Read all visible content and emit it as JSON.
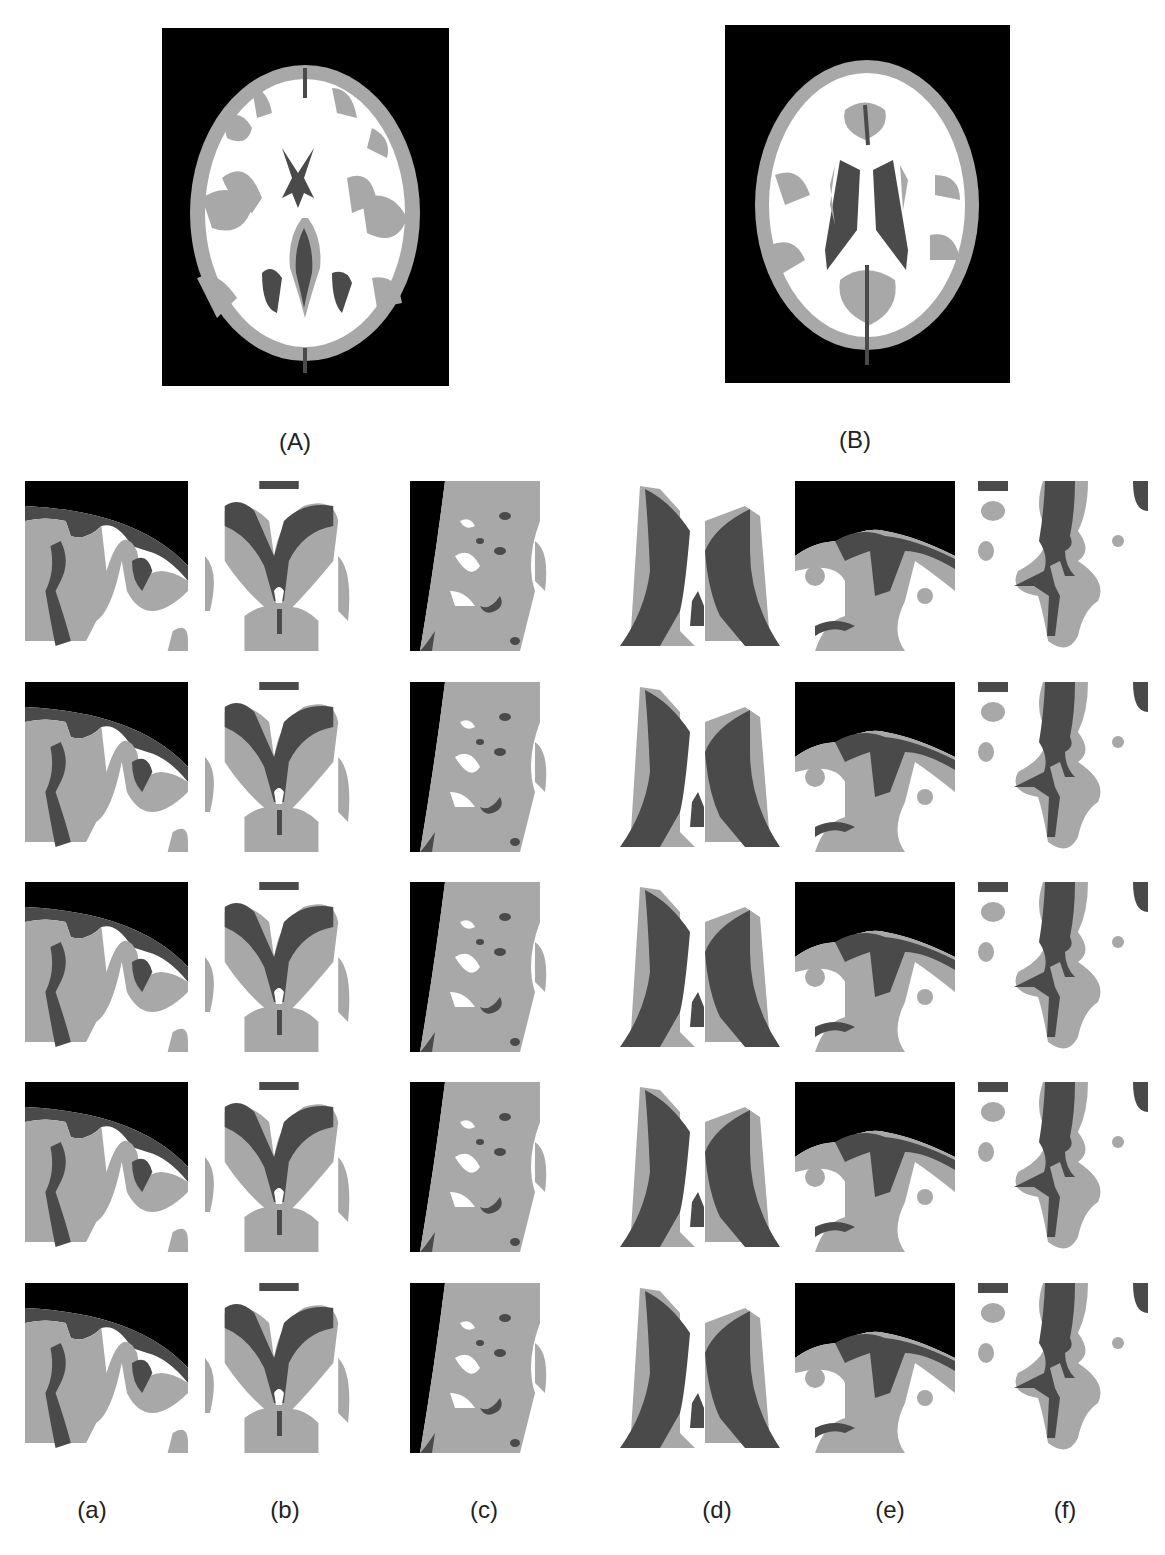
{
  "figure": {
    "panels": [
      {
        "id": "A",
        "label": "(A)",
        "description": "axial brain segmentation slice with lateral ventricle horns"
      },
      {
        "id": "B",
        "label": "(B)",
        "description": "axial brain segmentation slice with body of lateral ventricles"
      }
    ],
    "columns": [
      {
        "id": "a",
        "label": "(a)",
        "region": "cortical edge top-left"
      },
      {
        "id": "b",
        "label": "(b)",
        "region": "frontal horns of ventricles"
      },
      {
        "id": "c",
        "label": "(c)",
        "region": "lateral cortex edge"
      },
      {
        "id": "d",
        "label": "(d)",
        "region": "lateral ventricle bodies"
      },
      {
        "id": "e",
        "label": "(e)",
        "region": "superior cortex"
      },
      {
        "id": "f",
        "label": "(f)",
        "region": "sulcus detail"
      }
    ],
    "rows": 5,
    "tissue_colors": {
      "background": "#000000",
      "csf": "#4a4a4a",
      "gray_matter": "#a8a8a8",
      "white_matter": "#ffffff"
    },
    "caption_partial": "... segmentation results obtained by NICO. In rows (a), (b) and (c) ..."
  }
}
